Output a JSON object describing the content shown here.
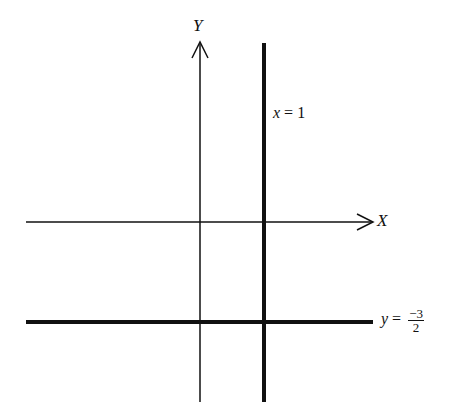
{
  "diagram": {
    "axes": {
      "x_label": "X",
      "y_label": "Y"
    },
    "lines": [
      {
        "equation_lhs": "x",
        "equals": "=",
        "equation_rhs": "1",
        "orientation": "vertical",
        "style": "thick"
      },
      {
        "equation_lhs": "y",
        "equals": "=",
        "numerator": "−3",
        "denominator": "2",
        "orientation": "horizontal",
        "style": "thick"
      }
    ],
    "colors": {
      "ink": "#111111",
      "background": "#ffffff"
    }
  }
}
